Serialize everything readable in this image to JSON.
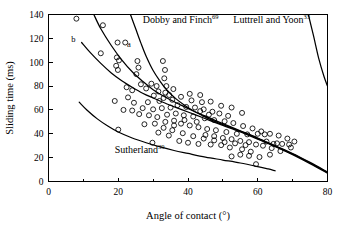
{
  "figure": {
    "background": "#ffffff",
    "stroke_color": "#000000",
    "width": 344,
    "height": 228
  },
  "chart_data": {
    "type": "scatter",
    "title": "",
    "xlabel": "Angle of contact (°)",
    "ylabel": "Sliding time (ms)",
    "xlim": [
      0,
      80
    ],
    "ylim": [
      0,
      140
    ],
    "xticks": [
      0,
      20,
      40,
      60,
      80
    ],
    "xticklabels": [
      "0",
      "20",
      "40",
      "60",
      "80"
    ],
    "xminorticks": [
      10,
      30,
      50,
      70
    ],
    "yticks": [
      0,
      20,
      40,
      60,
      80,
      100,
      120,
      140
    ],
    "yticklabels": [
      "0",
      "20",
      "40",
      "60",
      "80",
      "100",
      "120",
      "140"
    ],
    "grid": false,
    "legend": "inline-annotations",
    "marker": "open-circle",
    "series": [
      {
        "name": "Measured sliding time data",
        "type": "scatter",
        "marker": "open-circle",
        "points": [
          [
            8.0,
            136.5
          ],
          [
            15.6,
            131.0
          ],
          [
            15.0,
            107.5
          ],
          [
            19.8,
            116.5
          ],
          [
            22.0,
            116.5
          ],
          [
            19.6,
            104.0
          ],
          [
            20.2,
            101.5
          ],
          [
            19.4,
            97.0
          ],
          [
            19.9,
            93.5
          ],
          [
            25.5,
            101.0
          ],
          [
            25.8,
            95.5
          ],
          [
            25.2,
            90.0
          ],
          [
            32.8,
            101.0
          ],
          [
            33.4,
            93.5
          ],
          [
            33.2,
            86.5
          ],
          [
            29.5,
            82.0
          ],
          [
            31.0,
            80.0
          ],
          [
            33.8,
            80.0
          ],
          [
            22.4,
            79.0
          ],
          [
            24.0,
            76.5
          ],
          [
            31.5,
            75.5
          ],
          [
            33.5,
            74.5
          ],
          [
            34.6,
            72.5
          ],
          [
            22.8,
            70.5
          ],
          [
            19.0,
            67.5
          ],
          [
            24.5,
            66.0
          ],
          [
            28.5,
            66.5
          ],
          [
            31.8,
            67.5
          ],
          [
            35.5,
            68.5
          ],
          [
            38.0,
            71.0
          ],
          [
            40.5,
            73.5
          ],
          [
            43.5,
            72.5
          ],
          [
            41.0,
            68.0
          ],
          [
            44.0,
            66.5
          ],
          [
            46.5,
            67.0
          ],
          [
            49.5,
            63.5
          ],
          [
            52.5,
            62.0
          ],
          [
            55.5,
            57.5
          ],
          [
            47.0,
            58.5
          ],
          [
            49.0,
            57.0
          ],
          [
            44.5,
            60.5
          ],
          [
            42.0,
            62.0
          ],
          [
            39.5,
            62.5
          ],
          [
            37.0,
            64.0
          ],
          [
            35.0,
            62.0
          ],
          [
            32.5,
            61.5
          ],
          [
            30.0,
            60.5
          ],
          [
            27.0,
            61.5
          ],
          [
            24.0,
            59.5
          ],
          [
            21.5,
            60.0
          ],
          [
            26.0,
            56.5
          ],
          [
            28.8,
            55.5
          ],
          [
            31.2,
            54.0
          ],
          [
            34.0,
            56.0
          ],
          [
            36.5,
            57.0
          ],
          [
            38.8,
            55.5
          ],
          [
            41.5,
            54.5
          ],
          [
            44.8,
            53.0
          ],
          [
            47.5,
            51.5
          ],
          [
            50.5,
            50.5
          ],
          [
            53.0,
            49.0
          ],
          [
            55.8,
            46.5
          ],
          [
            58.5,
            44.5
          ],
          [
            61.0,
            42.0
          ],
          [
            63.5,
            40.0
          ],
          [
            66.0,
            38.5
          ],
          [
            68.5,
            36.0
          ],
          [
            70.5,
            33.5
          ],
          [
            65.5,
            32.0
          ],
          [
            62.5,
            33.5
          ],
          [
            59.5,
            31.0
          ],
          [
            56.5,
            30.5
          ],
          [
            53.5,
            32.0
          ],
          [
            50.5,
            33.0
          ],
          [
            47.5,
            34.5
          ],
          [
            44.5,
            36.0
          ],
          [
            41.5,
            38.0
          ],
          [
            38.5,
            40.5
          ],
          [
            35.5,
            43.0
          ],
          [
            33.0,
            45.0
          ],
          [
            36.0,
            47.0
          ],
          [
            38.0,
            48.5
          ],
          [
            40.5,
            47.0
          ],
          [
            43.0,
            45.5
          ],
          [
            45.5,
            44.0
          ],
          [
            48.0,
            43.0
          ],
          [
            51.0,
            41.5
          ],
          [
            54.0,
            40.0
          ],
          [
            57.0,
            39.5
          ],
          [
            60.0,
            40.0
          ],
          [
            62.0,
            39.5
          ],
          [
            64.5,
            31.5
          ],
          [
            67.0,
            31.5
          ],
          [
            69.0,
            31.0
          ],
          [
            69.5,
            28.5
          ],
          [
            66.5,
            25.5
          ],
          [
            63.5,
            22.5
          ],
          [
            60.5,
            20.5
          ],
          [
            57.5,
            21.5
          ],
          [
            55.0,
            22.5
          ],
          [
            52.5,
            21.0
          ],
          [
            59.5,
            14.5
          ],
          [
            20.0,
            43.5
          ],
          [
            29.8,
            32.5
          ],
          [
            37.5,
            34.0
          ],
          [
            40.0,
            32.5
          ],
          [
            43.0,
            31.5
          ],
          [
            46.5,
            31.0
          ],
          [
            49.5,
            30.5
          ],
          [
            52.0,
            28.5
          ],
          [
            55.5,
            27.0
          ],
          [
            58.0,
            25.0
          ],
          [
            34.5,
            38.5
          ],
          [
            31.5,
            41.0
          ],
          [
            45.0,
            39.0
          ],
          [
            47.5,
            38.0
          ],
          [
            50.0,
            36.5
          ],
          [
            52.5,
            35.5
          ],
          [
            55.0,
            34.0
          ],
          [
            57.5,
            33.0
          ],
          [
            61.5,
            30.0
          ],
          [
            64.0,
            28.0
          ],
          [
            42.5,
            50.0
          ],
          [
            39.0,
            51.5
          ],
          [
            36.0,
            51.0
          ],
          [
            33.5,
            50.0
          ],
          [
            30.5,
            48.5
          ],
          [
            27.5,
            48.0
          ],
          [
            33.0,
            70.0
          ],
          [
            35.8,
            77.5
          ],
          [
            30.2,
            72.0
          ],
          [
            28.0,
            78.0
          ],
          [
            26.5,
            81.5
          ],
          [
            43.5,
            59.0
          ],
          [
            46.0,
            56.0
          ],
          [
            51.5,
            55.0
          ]
        ]
      },
      {
        "name": "a",
        "type": "line",
        "label": "a",
        "label_position": [
          22.5,
          113.0
        ],
        "points": [
          [
            13.0,
            140.0
          ],
          [
            15.0,
            128.0
          ],
          [
            18.0,
            114.0
          ],
          [
            21.0,
            102.0
          ],
          [
            24.0,
            92.0
          ],
          [
            27.0,
            84.0
          ],
          [
            30.0,
            77.0
          ],
          [
            34.0,
            70.0
          ],
          [
            38.0,
            64.0
          ],
          [
            42.0,
            58.5
          ],
          [
            46.0,
            53.5
          ],
          [
            50.0,
            48.5
          ],
          [
            55.0,
            42.5
          ],
          [
            60.0,
            36.5
          ],
          [
            65.0,
            30.0
          ],
          [
            70.0,
            23.5
          ],
          [
            75.0,
            16.0
          ],
          [
            80.0,
            8.0
          ]
        ]
      },
      {
        "name": "b",
        "type": "line",
        "label": "b",
        "label_position": [
          6.5,
          117.0
        ],
        "points": [
          [
            9.5,
            116.5
          ],
          [
            12.0,
            108.0
          ],
          [
            15.0,
            99.0
          ],
          [
            18.0,
            91.0
          ],
          [
            21.0,
            84.5
          ],
          [
            24.0,
            79.0
          ],
          [
            27.0,
            74.0
          ],
          [
            30.0,
            70.0
          ],
          [
            34.0,
            65.0
          ],
          [
            38.0,
            60.5
          ],
          [
            42.0,
            56.0
          ],
          [
            46.0,
            51.5
          ],
          [
            50.0,
            47.0
          ],
          [
            55.0,
            41.5
          ],
          [
            60.0,
            35.5
          ],
          [
            65.0,
            29.5
          ],
          [
            70.0,
            23.0
          ],
          [
            75.0,
            15.5
          ],
          [
            80.0,
            7.5
          ]
        ]
      },
      {
        "name": "Dobby and Finch",
        "type": "line",
        "superscript": "69",
        "label": "Dobby and Finch",
        "label_position": [
          27.0,
          133.0
        ],
        "points": [
          [
            23.5,
            140.0
          ],
          [
            25.0,
            128.0
          ],
          [
            26.5,
            116.0
          ],
          [
            28.0,
            105.0
          ],
          [
            30.0,
            93.0
          ],
          [
            32.0,
            84.0
          ],
          [
            34.0,
            76.5
          ],
          [
            36.5,
            69.5
          ],
          [
            39.0,
            64.0
          ],
          [
            42.0,
            58.5
          ],
          [
            45.0,
            54.0
          ],
          [
            48.0,
            50.0
          ],
          [
            52.0,
            45.5
          ],
          [
            56.0,
            41.0
          ],
          [
            60.0,
            36.0
          ],
          [
            65.0,
            29.5
          ],
          [
            70.0,
            22.5
          ],
          [
            75.0,
            15.0
          ],
          [
            80.0,
            7.0
          ]
        ]
      },
      {
        "name": "Luttrell and Yoon",
        "type": "line",
        "superscript": "33",
        "label": "Luttrell and Yoon",
        "label_position": [
          53.0,
          133.0
        ],
        "points": [
          [
            74.5,
            140.0
          ],
          [
            76.0,
            122.0
          ],
          [
            77.5,
            103.0
          ],
          [
            79.0,
            88.0
          ],
          [
            80.0,
            80.0
          ]
        ]
      },
      {
        "name": "Sutherland",
        "type": "line",
        "superscript": "39",
        "label": "Sutherland",
        "label_position": [
          19.0,
          24.0
        ],
        "points": [
          [
            8.8,
            66.5
          ],
          [
            11.0,
            60.0
          ],
          [
            14.0,
            52.5
          ],
          [
            17.0,
            46.5
          ],
          [
            20.0,
            41.5
          ],
          [
            24.0,
            36.5
          ],
          [
            28.0,
            32.5
          ],
          [
            32.0,
            29.0
          ],
          [
            36.0,
            26.0
          ],
          [
            40.0,
            23.5
          ],
          [
            45.0,
            20.5
          ],
          [
            50.0,
            18.0
          ],
          [
            55.0,
            15.5
          ],
          [
            60.0,
            12.5
          ],
          [
            63.0,
            10.5
          ],
          [
            65.0,
            9.0
          ]
        ]
      }
    ]
  }
}
